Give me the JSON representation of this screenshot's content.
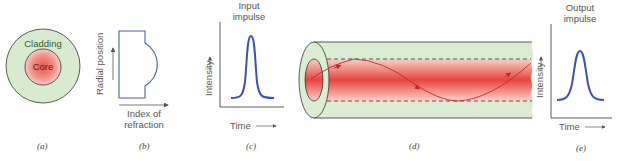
{
  "panel_a": {
    "caption": "(a)",
    "cladding_label": "Cladding",
    "core_label": "Core",
    "colors": {
      "cladding": "#d9ebcf",
      "core": "#e8524a",
      "outline": "#333333"
    }
  },
  "panel_b": {
    "caption": "(b)",
    "y_label": "Radial position",
    "x_label_line1": "Index of",
    "x_label_line2": "refraction",
    "colors": {
      "profile": "#4a5fb0"
    }
  },
  "panel_c": {
    "caption": "(c)",
    "title_line1": "Input",
    "title_line2": "impulse",
    "y_label": "Intensity",
    "x_label": "Time",
    "colors": {
      "pulse": "#3a52b0"
    }
  },
  "panel_d": {
    "caption": "(d)",
    "colors": {
      "cladding": "#dcecd2",
      "core": "#e8524a",
      "ray": "#c0282a"
    }
  },
  "panel_e": {
    "caption": "(e)",
    "title_line1": "Output",
    "title_line2": "impulse",
    "y_label": "Intensity",
    "x_label": "Time",
    "colors": {
      "pulse": "#3a52b0"
    }
  }
}
